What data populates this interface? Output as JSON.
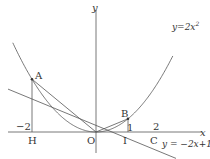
{
  "diagram": {
    "axes": {
      "x_label": "x",
      "y_label": "y",
      "origin_label": "O"
    },
    "curves": [
      {
        "name": "parabola",
        "equation": "y=2x",
        "exponent": "2"
      },
      {
        "name": "line",
        "equation": "y = −2x+1"
      }
    ],
    "points": {
      "A": {
        "label": "A",
        "x": -2,
        "y": 8
      },
      "B": {
        "label": "B",
        "x": 1,
        "y": 2
      },
      "C": {
        "label": "C",
        "x": 2,
        "y": 0
      },
      "H": {
        "label": "H",
        "x": -2,
        "y": 0
      },
      "I": {
        "label": "I",
        "x": 1,
        "y": 0
      }
    },
    "tick_labels": {
      "neg_two": "−2",
      "one": "1",
      "two": "2"
    },
    "colors": {
      "stroke": "#555555",
      "text": "#333333"
    }
  }
}
